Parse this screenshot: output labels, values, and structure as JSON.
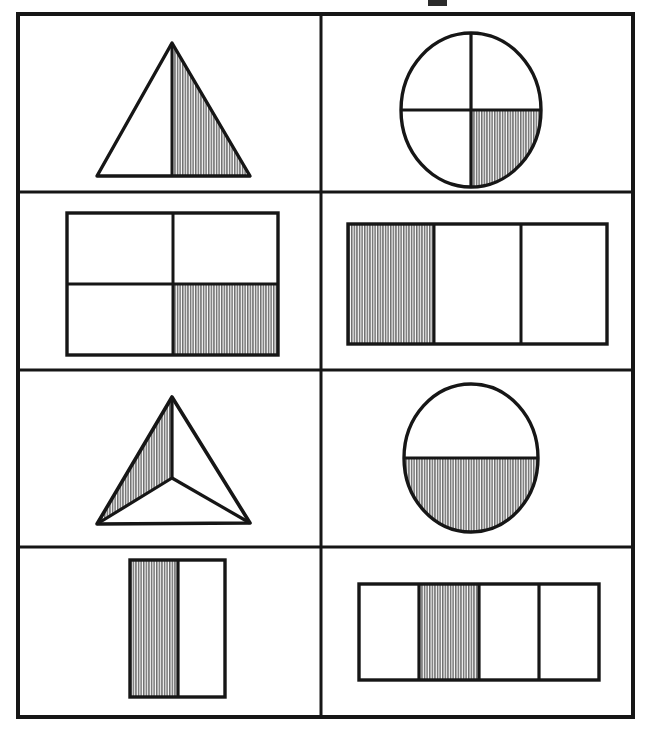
{
  "page": {
    "background_color": "#ffffff",
    "ink_color": "#1a1a1a",
    "shade_color": "#8c8c8c",
    "width": 645,
    "height": 733
  },
  "grid": {
    "name": "fraction-figure-grid",
    "rows": 4,
    "columns": 2,
    "outer_border_px": 4,
    "inner_border_px": 3,
    "bounds": {
      "left": 18,
      "top": 14,
      "right": 633,
      "bottom": 717
    },
    "row_dividers_y": [
      192,
      370,
      547
    ],
    "column_divider_x": 321
  },
  "top_artifact": {
    "name": "top-edge-mark",
    "visible": true
  },
  "cells": [
    {
      "id": "cell-1",
      "row": 1,
      "column": 1,
      "shape": "triangle",
      "shape_label": "Triangle",
      "parts_total": 2,
      "parts_shaded": 1,
      "fraction": "1/2",
      "shaded_part_position": "right half",
      "divider_lines": 1
    },
    {
      "id": "cell-2",
      "row": 1,
      "column": 2,
      "shape": "circle",
      "shape_label": "Circle",
      "parts_total": 4,
      "parts_shaded": 1,
      "fraction": "1/4",
      "shaded_part_position": "bottom-right quadrant",
      "divider_lines": 2
    },
    {
      "id": "cell-3",
      "row": 2,
      "column": 1,
      "shape": "square",
      "shape_label": "Square",
      "parts_total": 4,
      "parts_shaded": 1,
      "fraction": "1/4",
      "shaded_part_position": "bottom-right quarter",
      "divider_lines": 2
    },
    {
      "id": "cell-4",
      "row": 2,
      "column": 2,
      "shape": "rectangle",
      "shape_label": "Rectangle",
      "parts_total": 3,
      "parts_shaded": 1,
      "fraction": "1/3",
      "shaded_part_position": "left vertical third",
      "divider_lines": 2
    },
    {
      "id": "cell-5",
      "row": 3,
      "column": 1,
      "shape": "triangle",
      "shape_label": "Triangle",
      "parts_total": 3,
      "parts_shaded": 1,
      "fraction": "1/3",
      "shaded_part_position": "upper-left wedge from interior point",
      "divider_lines": 3
    },
    {
      "id": "cell-6",
      "row": 3,
      "column": 2,
      "shape": "circle",
      "shape_label": "Circle",
      "parts_total": 2,
      "parts_shaded": 1,
      "fraction": "1/2",
      "shaded_part_position": "bottom half",
      "divider_lines": 1
    },
    {
      "id": "cell-7",
      "row": 4,
      "column": 1,
      "shape": "rectangle",
      "shape_label": "Rectangle",
      "parts_total": 2,
      "parts_shaded": 1,
      "fraction": "1/2",
      "shaded_part_position": "left vertical half",
      "divider_lines": 1
    },
    {
      "id": "cell-8",
      "row": 4,
      "column": 2,
      "shape": "rectangle",
      "shape_label": "Rectangle",
      "parts_total": 4,
      "parts_shaded": 1,
      "fraction": "1/4",
      "shaded_part_position": "second vertical quarter from left",
      "divider_lines": 3
    }
  ]
}
